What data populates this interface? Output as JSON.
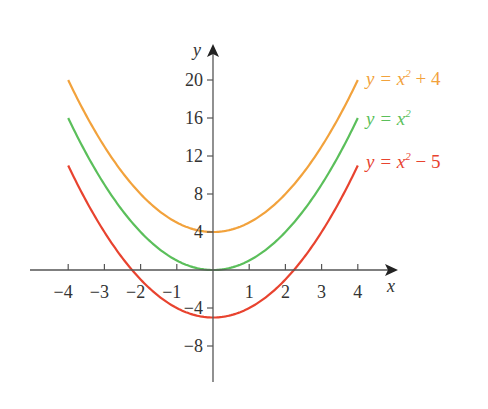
{
  "chart_data": {
    "type": "line",
    "title": "",
    "xlabel": "x",
    "ylabel": "y",
    "xlim": [
      -4,
      4
    ],
    "ylim": [
      -10,
      22
    ],
    "x_ticks": [
      -4,
      -3,
      -2,
      -1,
      1,
      2,
      3,
      4
    ],
    "x_tick_labels": [
      "−4",
      "−3",
      "−2",
      "−1",
      "1",
      "2",
      "3",
      "4"
    ],
    "y_ticks": [
      -8,
      -4,
      4,
      8,
      12,
      16,
      20
    ],
    "y_tick_labels": [
      "−8",
      "−4",
      "4",
      "8",
      "12",
      "16",
      "20"
    ],
    "grid": false,
    "legend_position": "right, inline labels",
    "series": [
      {
        "name": "y = x² + 4",
        "formula": "x^2+4",
        "color": "#f2a23c",
        "x": [
          -4,
          -3,
          -2,
          -1,
          0,
          1,
          2,
          3,
          4
        ],
        "values": [
          20,
          13,
          8,
          5,
          4,
          5,
          8,
          13,
          20
        ]
      },
      {
        "name": "y = x²",
        "formula": "x^2",
        "color": "#5bbf5b",
        "x": [
          -4,
          -3,
          -2,
          -1,
          0,
          1,
          2,
          3,
          4
        ],
        "values": [
          16,
          9,
          4,
          1,
          0,
          1,
          4,
          9,
          16
        ]
      },
      {
        "name": "y = x² − 5",
        "formula": "x^2-5",
        "color": "#e8432f",
        "x": [
          -4,
          -3,
          -2,
          -1,
          0,
          1,
          2,
          3,
          4
        ],
        "values": [
          11,
          4,
          -1,
          -4,
          -5,
          -4,
          -1,
          4,
          11
        ]
      }
    ]
  },
  "legend": {
    "items": [
      {
        "prefix": "y = x",
        "sup": "2",
        "suffix": " + 4",
        "color": "#f2a23c"
      },
      {
        "prefix": "y = x",
        "sup": "2",
        "suffix": "",
        "color": "#5bbf5b"
      },
      {
        "prefix": "y = x",
        "sup": "2",
        "suffix": " − 5",
        "color": "#e8432f"
      }
    ]
  },
  "axes": {
    "x_label": "x",
    "y_label": "y"
  }
}
